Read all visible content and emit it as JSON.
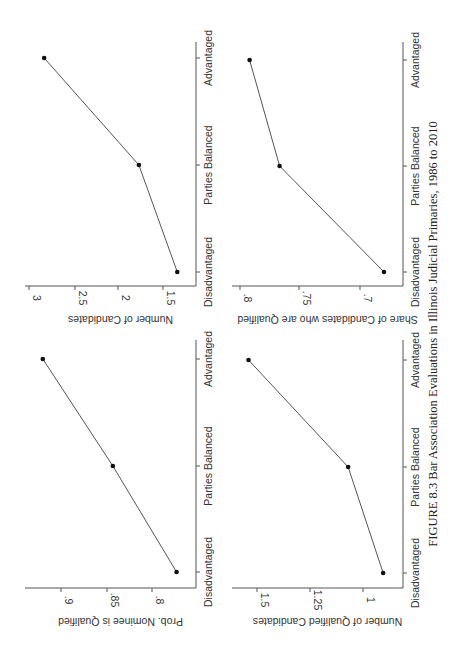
{
  "figure": {
    "caption": "FIGURE 8.3  Bar Association Evaluations in Illinois Judicial Primaries, 1986 to 2010"
  },
  "chart_data": [
    {
      "type": "line",
      "title": "",
      "xlabel": "",
      "ylabel": "Number of Candidates",
      "categories": [
        "Disadvantaged",
        "Parties Balanced",
        "Advantaged"
      ],
      "values": [
        1.34,
        1.77,
        2.83
      ],
      "yticks": [
        "1.5",
        "2",
        "2.5",
        "3"
      ],
      "ytick_values": [
        1.5,
        2,
        2.5,
        3
      ],
      "ylim": [
        1.25,
        3.05
      ],
      "grid": false,
      "legend": "none"
    },
    {
      "type": "line",
      "title": "",
      "xlabel": "",
      "ylabel": "Prob. Nominee is Qualified",
      "categories": [
        "Disadvantaged",
        "Parties Balanced",
        "Advantaged"
      ],
      "values": [
        0.773,
        0.843,
        0.92
      ],
      "yticks": [
        ".8",
        ".85",
        ".9"
      ],
      "ytick_values": [
        0.8,
        0.85,
        0.9
      ],
      "ylim": [
        0.755,
        0.935
      ],
      "grid": false,
      "legend": "none"
    },
    {
      "type": "line",
      "title": "",
      "xlabel": "",
      "ylabel": "Share of Candidates who are Qualified",
      "categories": [
        "Disadvantaged",
        "Parties Balanced",
        "Advantaged"
      ],
      "values": [
        0.68,
        0.767,
        0.792
      ],
      "yticks": [
        ".7",
        ".75",
        ".8"
      ],
      "ytick_values": [
        0.7,
        0.75,
        0.8
      ],
      "ylim": [
        0.67,
        0.81
      ],
      "grid": false,
      "legend": "none"
    },
    {
      "type": "line",
      "title": "",
      "xlabel": "",
      "ylabel": "Number of Qualified Candidates",
      "categories": [
        "Disadvantaged",
        "Parties Balanced",
        "Advantaged"
      ],
      "values": [
        0.905,
        1.07,
        1.54
      ],
      "yticks": [
        "1",
        "1.25",
        "1.5"
      ],
      "ytick_values": [
        1,
        1.25,
        1.5
      ],
      "ylim": [
        0.86,
        1.58
      ],
      "grid": false,
      "legend": "none"
    }
  ],
  "panels_layout": [
    {
      "catAxisX": 196,
      "catTop": 42,
      "catBottom": 286,
      "catTicksY": [
        272,
        165,
        58
      ],
      "valAxisY": 286,
      "valLeft": 25,
      "valPx": [
        163,
        118,
        75,
        29
      ]
    },
    {
      "catAxisX": 196,
      "catTop": 340,
      "catBottom": 588,
      "catTicksY": [
        572,
        466,
        359
      ],
      "valAxisY": 588,
      "valLeft": 25,
      "valPx": [
        152,
        107,
        61
      ]
    },
    {
      "catAxisX": 403,
      "catTop": 42,
      "catBottom": 286,
      "catTicksY": [
        272,
        166,
        60
      ],
      "valAxisY": 286,
      "valLeft": 232,
      "valPx": [
        360,
        299,
        240
      ]
    },
    {
      "catAxisX": 403,
      "catTop": 340,
      "catBottom": 588,
      "catTicksY": [
        573,
        467,
        360
      ],
      "valAxisY": 588,
      "valLeft": 232,
      "valPx": [
        363,
        310,
        257
      ]
    }
  ]
}
